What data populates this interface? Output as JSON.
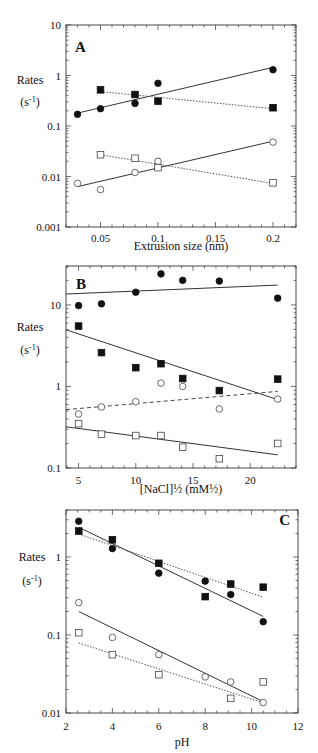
{
  "chart_data": [
    {
      "panel": "A",
      "type": "scatter",
      "title": "",
      "panel_label": "A",
      "xlabel": "Extrusion size (nm)",
      "ylabel": "Rates",
      "ylabel_unit": "(s-1)",
      "xscale": "linear",
      "yscale": "log",
      "xlim": [
        0.02,
        0.22
      ],
      "ylim": [
        0.001,
        10
      ],
      "xticks": [
        0.05,
        0.1,
        0.15,
        0.2
      ],
      "xtick_labels": [
        "0.05",
        "0.1",
        "0.15",
        "0.2"
      ],
      "yticks": [
        0.001,
        0.01,
        0.1,
        1,
        10
      ],
      "ytick_labels": [
        "0.001",
        "0.01",
        "0.1",
        "1",
        "10"
      ],
      "grid": false,
      "legend": null,
      "series": [
        {
          "name": "filled circles",
          "marker": "filled-circle",
          "x": [
            0.03,
            0.05,
            0.08,
            0.1,
            0.2
          ],
          "y": [
            0.17,
            0.22,
            0.28,
            0.7,
            1.3
          ],
          "fit": {
            "style": "solid",
            "x": [
              0.03,
              0.2
            ],
            "y": [
              0.18,
              1.45
            ]
          }
        },
        {
          "name": "filled squares",
          "marker": "filled-square",
          "x": [
            0.05,
            0.08,
            0.1,
            0.2
          ],
          "y": [
            0.52,
            0.42,
            0.31,
            0.23
          ],
          "fit": {
            "style": "dotted",
            "x": [
              0.05,
              0.2
            ],
            "y": [
              0.48,
              0.22
            ]
          }
        },
        {
          "name": "open circles",
          "marker": "open-circle",
          "x": [
            0.03,
            0.05,
            0.08,
            0.1,
            0.2
          ],
          "y": [
            0.0073,
            0.0055,
            0.012,
            0.02,
            0.048
          ],
          "fit": {
            "style": "solid",
            "x": [
              0.03,
              0.2
            ],
            "y": [
              0.0063,
              0.05
            ]
          }
        },
        {
          "name": "open squares",
          "marker": "open-square",
          "x": [
            0.05,
            0.08,
            0.1,
            0.2
          ],
          "y": [
            0.027,
            0.023,
            0.015,
            0.0075
          ],
          "fit": {
            "style": "dotted",
            "x": [
              0.05,
              0.2
            ],
            "y": [
              0.027,
              0.0073
            ]
          }
        }
      ]
    },
    {
      "panel": "B",
      "type": "scatter",
      "title": "",
      "panel_label": "B",
      "xlabel": "[NaCl]½ (mM½)",
      "ylabel": "Rates",
      "ylabel_unit": "(s-1)",
      "xscale": "linear",
      "yscale": "log",
      "xlim": [
        3.9,
        24
      ],
      "ylim": [
        0.1,
        30
      ],
      "xticks": [
        5,
        10,
        15,
        20
      ],
      "xtick_labels": [
        "5",
        "10",
        "15",
        "20"
      ],
      "yticks": [
        0.1,
        1,
        10
      ],
      "ytick_labels": [
        "0.1",
        "1",
        "10"
      ],
      "grid": false,
      "legend": null,
      "series": [
        {
          "name": "filled circles",
          "marker": "filled-circle",
          "x": [
            5,
            7,
            10,
            12.2,
            14.1,
            17.3,
            22.4
          ],
          "y": [
            9.8,
            10.3,
            14.3,
            24,
            20,
            19.6,
            12.1
          ],
          "fit": {
            "style": "solid",
            "x": [
              3.9,
              22.4
            ],
            "y": [
              13.6,
              17.5
            ]
          }
        },
        {
          "name": "filled squares",
          "marker": "filled-square",
          "x": [
            5,
            7,
            10,
            12.2,
            14.1,
            17.3,
            22.4
          ],
          "y": [
            5.5,
            2.6,
            1.7,
            1.9,
            1.25,
            0.89,
            1.23
          ],
          "fit": {
            "style": "solid",
            "x": [
              3.9,
              22.4
            ],
            "y": [
              4.95,
              0.69
            ]
          }
        },
        {
          "name": "open circles",
          "marker": "open-circle",
          "x": [
            5,
            7,
            10,
            12.2,
            14.1,
            17.3,
            22.4
          ],
          "y": [
            0.46,
            0.56,
            0.65,
            1.1,
            1.0,
            0.53,
            0.7
          ],
          "fit": {
            "style": "dashed",
            "x": [
              3.9,
              22.4
            ],
            "y": [
              0.52,
              0.87
            ]
          }
        },
        {
          "name": "open squares",
          "marker": "open-square",
          "x": [
            5,
            7,
            10,
            12.2,
            14.1,
            17.3,
            22.4
          ],
          "y": [
            0.35,
            0.26,
            0.25,
            0.25,
            0.18,
            0.13,
            0.2
          ],
          "fit": {
            "style": "solid",
            "x": [
              3.9,
              22.4
            ],
            "y": [
              0.32,
              0.145
            ]
          }
        }
      ]
    },
    {
      "panel": "C",
      "type": "scatter",
      "title": "",
      "panel_label": "C",
      "xlabel": "pH",
      "ylabel": "Rates",
      "ylabel_unit": "(s-1)",
      "xscale": "linear",
      "yscale": "log",
      "xlim": [
        2,
        12
      ],
      "ylim": [
        0.01,
        4
      ],
      "xticks": [
        2,
        4,
        6,
        8,
        10,
        12
      ],
      "xtick_labels": [
        "2",
        "4",
        "6",
        "8",
        "10",
        "12"
      ],
      "yticks": [
        0.01,
        0.1,
        1
      ],
      "ytick_labels": [
        "0.01",
        "0.1",
        "1"
      ],
      "grid": false,
      "legend": null,
      "series": [
        {
          "name": "filled circles",
          "marker": "filled-circle",
          "x": [
            2.55,
            4,
            6,
            8,
            9.1,
            10.5
          ],
          "y": [
            2.87,
            1.28,
            0.62,
            0.49,
            0.33,
            0.148
          ],
          "fit": {
            "style": "solid",
            "x": [
              2.55,
              10.5
            ],
            "y": [
              2.4,
              0.173
            ]
          }
        },
        {
          "name": "filled squares",
          "marker": "filled-square",
          "x": [
            2.55,
            4,
            6,
            8,
            9.1,
            10.5
          ],
          "y": [
            2.15,
            1.66,
            0.83,
            0.31,
            0.45,
            0.41
          ],
          "fit": {
            "style": "dotted",
            "x": [
              2.55,
              10.5
            ],
            "y": [
              1.97,
              0.305
            ]
          }
        },
        {
          "name": "open circles",
          "marker": "open-circle",
          "x": [
            2.55,
            4,
            6,
            8,
            9.1,
            10.5
          ],
          "y": [
            0.26,
            0.093,
            0.056,
            0.029,
            0.025,
            0.0136
          ],
          "fit": {
            "style": "solid",
            "x": [
              2.55,
              10.5
            ],
            "y": [
              0.2,
              0.014
            ]
          }
        },
        {
          "name": "open squares",
          "marker": "open-square",
          "x": [
            2.55,
            4,
            6,
            9.1,
            10.5
          ],
          "y": [
            0.107,
            0.056,
            0.031,
            0.0154,
            0.025
          ],
          "fit": {
            "style": "dotted",
            "x": [
              2.55,
              10.5
            ],
            "y": [
              0.079,
              0.0135
            ]
          }
        }
      ]
    }
  ],
  "layout": {
    "panels": [
      {
        "frame": [
          66,
          25,
          296,
          227
        ],
        "label_pos": [
          75,
          52
        ],
        "label_anchor": "start",
        "ylabel_pos": [
          30,
          84
        ],
        "yunit_pos": [
          30,
          106
        ],
        "xlabel_y": 250,
        "xtick_y": 242,
        "minor_x": 0.01
      },
      {
        "frame": [
          66,
          266,
          296,
          468
        ],
        "label_pos": [
          76,
          289
        ],
        "label_anchor": "start",
        "ylabel_pos": [
          30,
          331
        ],
        "yunit_pos": [
          30,
          354
        ],
        "xlabel_y": 493,
        "xtick_y": 484,
        "minor_x": 1
      },
      {
        "frame": [
          66,
          510,
          298,
          713
        ],
        "label_pos": [
          290,
          525
        ],
        "label_anchor": "end",
        "ylabel_pos": [
          32,
          561
        ],
        "yunit_pos": [
          32,
          585
        ],
        "xlabel_y": 746,
        "xtick_y": 730,
        "minor_x": 0.5
      }
    ]
  }
}
